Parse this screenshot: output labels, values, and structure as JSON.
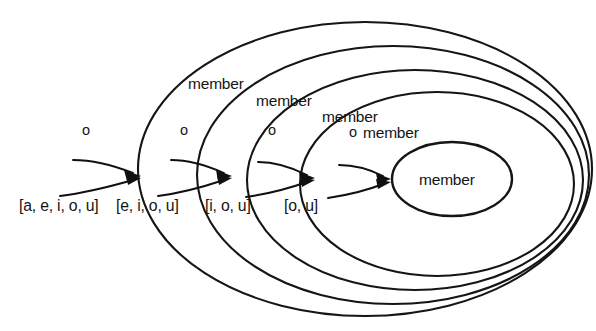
{
  "diagram": {
    "stroke_color": "#151515",
    "text_color": "#141414",
    "background_color": "#ffffff",
    "levels": [
      {
        "index": 1,
        "member_label": "member",
        "arg_label": "o",
        "list_label": "[a, e, i, o, u]",
        "member_label_x": 188,
        "member_label_y": 89,
        "arg_label_x": 82,
        "arg_label_y": 135,
        "list_label_x": 19,
        "list_label_y": 211,
        "ellipse_cx": 365,
        "ellipse_cy": 169,
        "ellipse_rx": 227,
        "ellipse_ry": 147
      },
      {
        "index": 2,
        "member_label": "member",
        "arg_label": "o",
        "list_label": "[e, i, o, u]",
        "member_label_x": 256,
        "member_label_y": 106,
        "arg_label_x": 180,
        "arg_label_y": 135,
        "list_label_x": 116,
        "list_label_y": 211,
        "ellipse_cx": 393,
        "ellipse_cy": 175,
        "ellipse_rx": 196,
        "ellipse_ry": 129
      },
      {
        "index": 3,
        "member_label": "member",
        "arg_label": "o",
        "list_label": "[i, o, u]",
        "member_label_x": 322,
        "member_label_y": 122,
        "arg_label_x": 268,
        "arg_label_y": 135,
        "list_label_x": 205,
        "list_label_y": 211,
        "ellipse_cx": 415,
        "ellipse_cy": 180,
        "ellipse_rx": 168,
        "ellipse_ry": 110
      },
      {
        "index": 4,
        "member_label": "member",
        "arg_label": "o",
        "list_label": "[o, u]",
        "member_label_x": 363,
        "member_label_y": 138,
        "arg_label_x": 349,
        "arg_label_y": 137,
        "list_label_x": 284,
        "list_label_y": 211,
        "ellipse_cx": 437,
        "ellipse_cy": 184,
        "ellipse_rx": 137,
        "ellipse_ry": 92
      },
      {
        "index": 5,
        "member_label": "member",
        "member_label_x": 419,
        "member_label_y": 185,
        "ellipse_cx": 452,
        "ellipse_cy": 179,
        "ellipse_rx": 60,
        "ellipse_ry": 37
      }
    ],
    "arrows": [
      {
        "name": "arrow-1-upper",
        "d": "M 73 160 C 95 160 115 166 133 173",
        "head": "141 176 124 170 127 181"
      },
      {
        "name": "arrow-1-lower",
        "d": "M 60 196 C 85 193 112 186 133 180",
        "head": "141 178 126 175 128 185"
      },
      {
        "name": "arrow-2-upper",
        "d": "M 171 160 C 190 160 208 166 224 173",
        "head": "232 176 216 170 218 181"
      },
      {
        "name": "arrow-2-lower",
        "d": "M 158 196 C 182 193 206 186 224 180",
        "head": "232 178 217 175 219 185"
      },
      {
        "name": "arrow-3-upper",
        "d": "M 258 162 C 276 162 293 168 307 175",
        "head": "315 178 299 172 301 183"
      },
      {
        "name": "arrow-3-lower",
        "d": "M 246 197 C 268 194 290 188 307 182",
        "head": "315 180 300 177 302 187"
      },
      {
        "name": "arrow-4-upper",
        "d": "M 339 165 C 355 165 371 170 383 176",
        "head": "391 179 376 173 378 184"
      },
      {
        "name": "arrow-4-lower",
        "d": "M 328 198 C 348 195 368 190 383 184",
        "head": "391 182 376 179 378 189"
      }
    ]
  }
}
